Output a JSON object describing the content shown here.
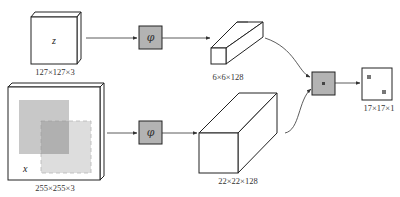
{
  "diagram": {
    "inputs": {
      "exemplar": {
        "symbol": "z",
        "size_label": "127×127×3"
      },
      "search": {
        "symbol": "x",
        "size_label": "255×255×3"
      }
    },
    "embedding": {
      "symbol": "φ",
      "color": "#b3b3b3"
    },
    "features": {
      "exemplar": {
        "size_label": "6×6×128"
      },
      "search": {
        "size_label": "22×22×128"
      }
    },
    "correlation": {
      "symbol": "*",
      "color": "#b3b3b3"
    },
    "output": {
      "size_label": "17×17×1"
    },
    "colors": {
      "stroke": "#222222",
      "search_patch_dark": "#a8a8a8",
      "search_patch_light": "#cfcfcf"
    }
  }
}
